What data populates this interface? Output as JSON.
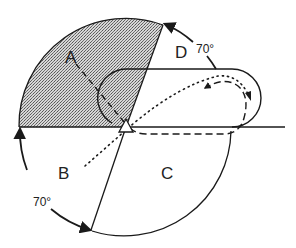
{
  "diagram": {
    "type": "rotation-sector-diagram",
    "regions": [
      {
        "id": "A",
        "label": "A",
        "shaded": true
      },
      {
        "id": "B",
        "label": "B",
        "shaded": false
      },
      {
        "id": "C",
        "label": "C",
        "shaded": false
      },
      {
        "id": "D",
        "label": "D",
        "shaded": false
      }
    ],
    "angle_labels": {
      "upper": "70°",
      "lower": "70°"
    },
    "colors": {
      "stroke": "#1a1a1a",
      "shade": "#9a9a9a",
      "background": "#ffffff"
    },
    "elements": {
      "center_marker": "triangle",
      "paths": [
        "dashed",
        "dotted"
      ]
    }
  }
}
